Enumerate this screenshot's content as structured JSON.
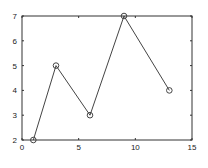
{
  "chart_data": {
    "type": "line",
    "title": "",
    "xlabel": "",
    "ylabel": "",
    "x": [
      1,
      3,
      6,
      9,
      13
    ],
    "series": [
      {
        "name": "series-1",
        "values": [
          2,
          5,
          3,
          7,
          4
        ],
        "marker": "circle-open",
        "color": "#444444"
      }
    ],
    "xlim": [
      0,
      15
    ],
    "ylim": [
      2,
      7
    ],
    "xticks": [
      0,
      5,
      10,
      15
    ],
    "yticks": [
      2,
      3,
      4,
      5,
      6,
      7
    ],
    "grid": false,
    "legend": "none"
  }
}
